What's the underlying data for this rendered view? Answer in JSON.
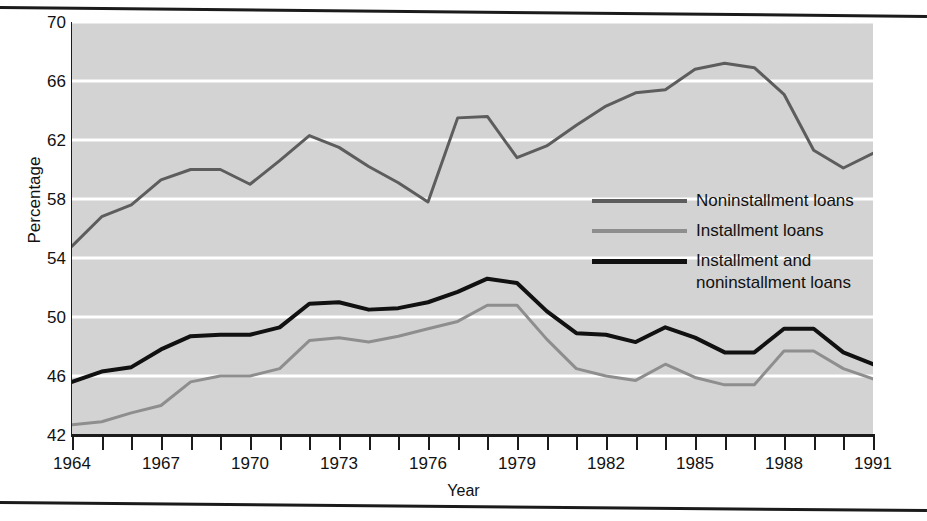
{
  "chart_data": {
    "type": "line",
    "title": "",
    "xlabel": "Year",
    "ylabel": "Percentage",
    "xlim": [
      1964,
      1991
    ],
    "ylim": [
      42,
      70
    ],
    "yticks": [
      42,
      46,
      50,
      54,
      58,
      62,
      66,
      70
    ],
    "xticks": [
      1964,
      1967,
      1970,
      1973,
      1976,
      1979,
      1982,
      1985,
      1988,
      1991
    ],
    "xtick_labels": [
      "1964",
      "1967",
      "1970",
      "1973",
      "1976",
      "1979",
      "1982",
      "1985",
      "1988",
      "1991"
    ],
    "ytick_labels": [
      "42",
      "46",
      "50",
      "54",
      "58",
      "62",
      "66",
      "70"
    ],
    "x_minor_tick_step": 1,
    "grid": "horizontal-white-on-gray",
    "legend_position": "center-right-inside",
    "plot_background": "#d3d3d3",
    "gridline_color": "#ffffff",
    "x": [
      1964,
      1965,
      1966,
      1967,
      1968,
      1969,
      1970,
      1971,
      1972,
      1973,
      1974,
      1975,
      1976,
      1977,
      1978,
      1979,
      1980,
      1981,
      1982,
      1983,
      1984,
      1985,
      1986,
      1987,
      1988,
      1989,
      1990,
      1991
    ],
    "series": [
      {
        "name": "Noninstallment loans",
        "color": "#5d5d5d",
        "width": 3,
        "values": [
          54.8,
          56.8,
          57.6,
          59.3,
          60.0,
          60.0,
          59.0,
          60.6,
          62.3,
          61.5,
          60.2,
          59.1,
          57.8,
          63.5,
          63.6,
          60.8,
          61.6,
          63.0,
          64.3,
          65.2,
          65.4,
          66.8,
          67.2,
          66.9,
          65.1,
          61.3,
          60.1,
          61.1
        ]
      },
      {
        "name": "Installment loans",
        "color": "#8e8e8e",
        "width": 3,
        "values": [
          42.7,
          42.9,
          43.5,
          44.0,
          45.6,
          46.0,
          46.0,
          46.5,
          48.4,
          48.6,
          48.3,
          48.7,
          49.2,
          49.7,
          50.8,
          50.8,
          48.5,
          46.5,
          46.0,
          45.7,
          46.8,
          45.9,
          45.4,
          45.4,
          47.7,
          47.7,
          46.5,
          45.8
        ]
      },
      {
        "name": "Installment and\nnoninstallment loans",
        "color": "#111111",
        "width": 4,
        "values": [
          45.6,
          46.3,
          46.6,
          47.8,
          48.7,
          48.8,
          48.8,
          49.3,
          50.9,
          51.0,
          50.5,
          50.6,
          51.0,
          51.7,
          52.6,
          52.3,
          50.4,
          48.9,
          48.8,
          48.3,
          49.3,
          48.6,
          47.6,
          47.6,
          49.2,
          49.2,
          47.6,
          46.8
        ]
      }
    ]
  },
  "axis": {
    "y_title": "Percentage",
    "x_title": "Year"
  },
  "legend": {
    "items": [
      {
        "label": "Noninstallment loans",
        "swatch": "line-swatch-noninstallment"
      },
      {
        "label": "Installment loans",
        "swatch": "line-swatch-installment"
      },
      {
        "label": "Installment and\nnoninstallment loans",
        "swatch": "line-swatch-both"
      }
    ]
  }
}
